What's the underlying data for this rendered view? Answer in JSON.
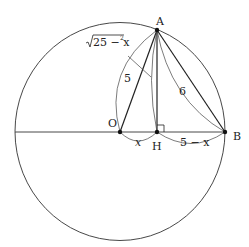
{
  "diagram": {
    "points": {
      "A": {
        "label": "A",
        "x": 157,
        "y": 30
      },
      "O": {
        "label": "O",
        "x": 120,
        "y": 132
      },
      "H": {
        "label": "H",
        "x": 157,
        "y": 132
      },
      "B": {
        "label": "B",
        "x": 225,
        "y": 132
      }
    },
    "labels": {
      "OA": "5",
      "AB": "6",
      "AH_sqrt": "25 − x",
      "AH_exp": "2",
      "OH": "x",
      "HB": "5 − x"
    },
    "colors": {
      "stroke": "#222222",
      "background": "#ffffff"
    }
  }
}
